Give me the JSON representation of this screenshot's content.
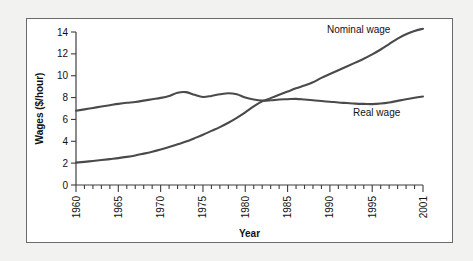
{
  "chart_data": {
    "type": "line",
    "title": "",
    "xlabel": "Year",
    "ylabel": "Wages ($/hour)",
    "xlim": [
      1960,
      2001
    ],
    "ylim": [
      0,
      14
    ],
    "grid": false,
    "legend_position": "inline-right",
    "y_ticks": [
      0,
      2,
      4,
      6,
      8,
      10,
      12,
      14
    ],
    "y_tick_labels": [
      "0",
      "2",
      "4",
      "6",
      "8",
      "10",
      "12",
      "14"
    ],
    "x_ticks": [
      1960,
      1965,
      1970,
      1975,
      1980,
      1985,
      1990,
      1995,
      2001
    ],
    "x_tick_labels": [
      "1960",
      "1965",
      "1970",
      "1975",
      "1980",
      "1985",
      "1990",
      "1995",
      "2001"
    ],
    "x_minor_tick_interval": 1,
    "x": [
      1960,
      1961,
      1962,
      1963,
      1964,
      1965,
      1966,
      1967,
      1968,
      1969,
      1970,
      1971,
      1972,
      1973,
      1974,
      1975,
      1976,
      1977,
      1978,
      1979,
      1980,
      1981,
      1982,
      1983,
      1984,
      1985,
      1986,
      1987,
      1988,
      1989,
      1990,
      1991,
      1992,
      1993,
      1994,
      1995,
      1996,
      1997,
      1998,
      1999,
      2000,
      2001
    ],
    "series": [
      {
        "name": "Nominal wage",
        "label": "Nominal wage",
        "color": "#4a4a4a",
        "values": [
          2.05,
          2.12,
          2.2,
          2.28,
          2.37,
          2.46,
          2.57,
          2.7,
          2.87,
          3.05,
          3.25,
          3.47,
          3.72,
          3.97,
          4.28,
          4.6,
          4.95,
          5.3,
          5.7,
          6.15,
          6.65,
          7.2,
          7.65,
          7.95,
          8.25,
          8.55,
          8.85,
          9.1,
          9.4,
          9.8,
          10.15,
          10.5,
          10.85,
          11.2,
          11.55,
          11.95,
          12.4,
          12.9,
          13.4,
          13.8,
          14.1,
          14.3
        ]
      },
      {
        "name": "Real wage",
        "label": "Real wage",
        "color": "#4a4a4a",
        "values": [
          6.8,
          6.92,
          7.05,
          7.18,
          7.3,
          7.42,
          7.52,
          7.6,
          7.72,
          7.85,
          7.97,
          8.15,
          8.45,
          8.5,
          8.25,
          8.05,
          8.15,
          8.3,
          8.4,
          8.3,
          8.0,
          7.82,
          7.72,
          7.75,
          7.82,
          7.85,
          7.88,
          7.82,
          7.75,
          7.68,
          7.62,
          7.55,
          7.5,
          7.45,
          7.42,
          7.4,
          7.45,
          7.55,
          7.7,
          7.85,
          7.98,
          8.1
        ]
      }
    ]
  }
}
